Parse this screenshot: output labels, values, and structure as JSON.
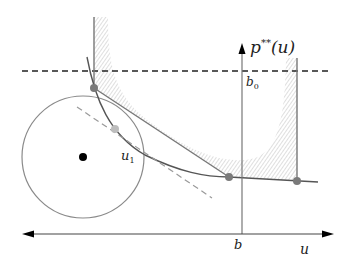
{
  "figure": {
    "width": 364,
    "height": 266,
    "colors": {
      "axis": "#222222",
      "curve": "#666666",
      "circle": "#8a8a8a",
      "hatch": "#d6d6d6",
      "dot": "#7a7a7a",
      "dot_light": "#bdbdbd",
      "center_dot": "#000000",
      "dashed_light": "#9a9a9a"
    }
  },
  "labels": {
    "y_axis": "p**(u)",
    "y_axis_base": "p",
    "y_axis_sup": "**",
    "y_axis_arg": "(u)",
    "b0": "b",
    "b0_sub": "0",
    "u1": "u",
    "u1_sub": "1",
    "b": "b",
    "u": "u"
  },
  "elements": {
    "u_axis": {
      "x1": 22,
      "x2": 333,
      "y": 234,
      "arrows": "both"
    },
    "p_axis": {
      "x": 242,
      "y1": 234,
      "y2": 44,
      "arrow": "up"
    },
    "b0_dashed_line": {
      "y": 71,
      "x1": 22,
      "x2": 330
    },
    "circle": {
      "cx": 83,
      "cy": 157,
      "r": 61
    },
    "points": [
      {
        "name": "upper-left-contact",
        "x": 94,
        "y": 88
      },
      {
        "name": "u1-point",
        "x": 115,
        "y": 129,
        "light": true
      },
      {
        "name": "lower-contact",
        "x": 229,
        "y": 177
      },
      {
        "name": "right-contact",
        "x": 297,
        "y": 181
      }
    ]
  }
}
